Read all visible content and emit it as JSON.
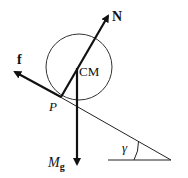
{
  "diagram": {
    "labels": {
      "normal_force": "N",
      "friction_force": "f",
      "center_of_mass": "CM",
      "contact_point": "P",
      "gravity_main": "M",
      "gravity_sub": "g",
      "incline_angle": "γ"
    },
    "colors": {
      "stroke": "#111111",
      "background": "#ffffff"
    }
  }
}
